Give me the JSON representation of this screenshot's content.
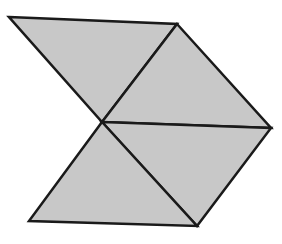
{
  "figure": {
    "fill_color": "#c8c8c8",
    "stroke_color": "#1a1a1a",
    "stroke_width": 2.5,
    "vertices": {
      "A": [
        9,
        17
      ],
      "B": [
        177,
        24
      ],
      "C": [
        102,
        122
      ],
      "D": [
        271,
        128
      ],
      "E": [
        197,
        226
      ],
      "F": [
        29,
        221
      ]
    },
    "triangles": [
      {
        "name": "top-left-triangle",
        "points": [
          "A",
          "B",
          "C"
        ]
      },
      {
        "name": "top-right-triangle",
        "points": [
          "B",
          "D",
          "C"
        ]
      },
      {
        "name": "bottom-right-triangle",
        "points": [
          "C",
          "D",
          "E"
        ]
      },
      {
        "name": "bottom-left-triangle",
        "points": [
          "C",
          "E",
          "F"
        ]
      }
    ]
  }
}
